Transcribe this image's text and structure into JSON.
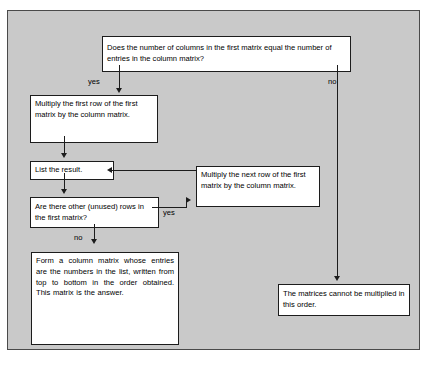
{
  "diagram": {
    "background_color": "#c9c9c9",
    "box_fill_color": "#ffffff",
    "line_color": "#1c1c1c",
    "nodes": {
      "question": "Does the number of columns in the first matrix equal the number of entries in the column matrix?",
      "multiply_first_row": "Multiply the first row of the first matrix by the column matrix.",
      "list_result": "List the result.",
      "are_there_other_rows": "Are there other (unused) rows in the first matrix?",
      "multiply_next_row": "Multiply the next row of the first matrix by the column matrix.",
      "form_column_matrix": "Form a column matrix whose entries are the numbers in the list, written from top to bottom in the order obtained. This matrix is the answer.",
      "cannot_multiply": "The matrices cannot be multiplied in this order."
    },
    "edge_labels": {
      "question_yes": "yes",
      "question_no": "no",
      "rows_yes": "yes",
      "rows_no": "no"
    }
  }
}
